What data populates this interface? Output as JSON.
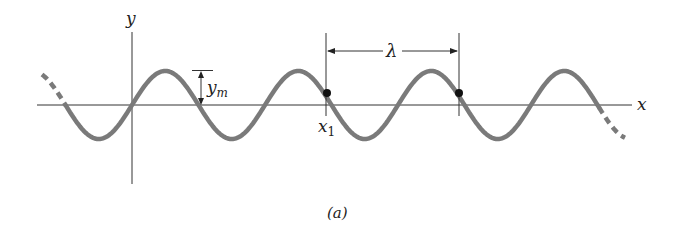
{
  "figure": {
    "caption": "(a)",
    "axes": {
      "x_label": "x",
      "y_label": "y"
    },
    "annotations": {
      "amplitude_label": "y",
      "amplitude_subscript": "m",
      "wavelength_label": "λ",
      "point_label": "x",
      "point_subscript": "1"
    },
    "colors": {
      "wave": "#7a7a7a",
      "axis": "#333333",
      "dot": "#111111"
    }
  }
}
